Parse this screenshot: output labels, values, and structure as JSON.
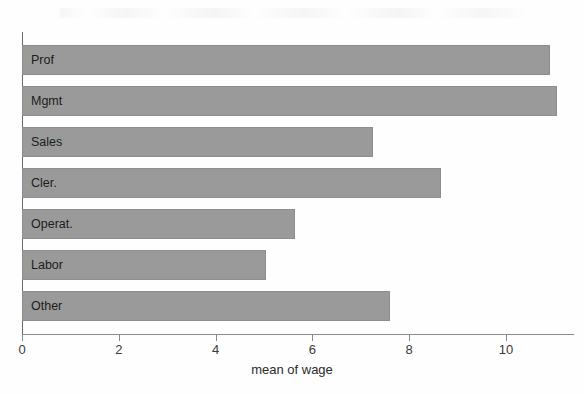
{
  "chart_data": {
    "type": "bar",
    "orientation": "horizontal",
    "title": "",
    "xlabel": "mean of wage",
    "ylabel": "",
    "categories": [
      "Prof",
      "Mgmt",
      "Sales",
      "Cler.",
      "Operat.",
      "Labor",
      "Other"
    ],
    "values": [
      10.9,
      11.05,
      7.25,
      8.65,
      5.65,
      5.05,
      7.6
    ],
    "xticks": [
      0,
      2,
      4,
      6,
      8,
      10
    ],
    "xtick_labels": [
      "0",
      "2",
      "4",
      "6",
      "8",
      "10"
    ],
    "xlim": [
      0,
      11.4
    ],
    "grid": false,
    "legend": false,
    "bar_color": "#9a9a9a",
    "bar_edge_color": "#8d8d8d",
    "axis_color": "#8a8a8a",
    "text_color": "#2b2b2b",
    "background": "#fefefe"
  }
}
